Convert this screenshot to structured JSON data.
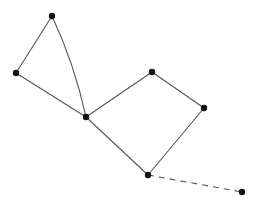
{
  "diagram": {
    "type": "graph",
    "colors": {
      "edge": "#555555",
      "node": "#111111",
      "background": "#ffffff"
    },
    "nodes": [
      {
        "id": "n1",
        "x": 52,
        "y": 16
      },
      {
        "id": "n2",
        "x": 16,
        "y": 73
      },
      {
        "id": "n3",
        "x": 86,
        "y": 117
      },
      {
        "id": "n4",
        "x": 152,
        "y": 72
      },
      {
        "id": "n5",
        "x": 204,
        "y": 108
      },
      {
        "id": "n6",
        "x": 148,
        "y": 175
      },
      {
        "id": "n7",
        "x": 242,
        "y": 192
      }
    ],
    "edges": [
      {
        "from": "n1",
        "to": "n2",
        "style": "solid"
      },
      {
        "from": "n1",
        "to": "n3",
        "style": "solid",
        "curved": true
      },
      {
        "from": "n2",
        "to": "n3",
        "style": "solid"
      },
      {
        "from": "n3",
        "to": "n4",
        "style": "solid"
      },
      {
        "from": "n4",
        "to": "n5",
        "style": "solid"
      },
      {
        "from": "n5",
        "to": "n6",
        "style": "solid"
      },
      {
        "from": "n3",
        "to": "n6",
        "style": "solid"
      },
      {
        "from": "n6",
        "to": "n7",
        "style": "dashed"
      }
    ]
  }
}
